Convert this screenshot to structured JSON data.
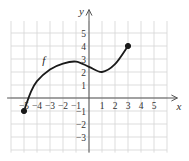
{
  "chart_data": {
    "type": "line",
    "title": "",
    "xlabel": "x",
    "ylabel": "y",
    "function_label": "f",
    "xlim": [
      -6,
      6
    ],
    "ylim": [
      -4,
      6
    ],
    "grid": true,
    "x_tick_labels": [
      "-5",
      "-4",
      "-3",
      "-2",
      "-1",
      "1",
      "2",
      "3",
      "4",
      "5"
    ],
    "y_tick_labels": [
      "5",
      "4",
      "3",
      "2",
      "1",
      "-1",
      "-2",
      "-3"
    ],
    "x_ticks": [
      -5,
      -4,
      -3,
      -2,
      -1,
      1,
      2,
      3,
      4,
      5
    ],
    "y_ticks": [
      5,
      4,
      3,
      2,
      1,
      -1,
      -2,
      -3
    ],
    "series": [
      {
        "name": "f",
        "x": [
          -5,
          -4.5,
          -4,
          -3,
          -2,
          -1,
          0,
          1,
          2,
          3
        ],
        "y": [
          -1,
          0.4,
          1.3,
          2.2,
          2.65,
          2.8,
          2.4,
          2.0,
          2.6,
          4.0
        ]
      }
    ],
    "endpoints": [
      {
        "x": -5,
        "y": -1,
        "filled": true
      },
      {
        "x": 3,
        "y": 4,
        "filled": true
      }
    ],
    "colors": {
      "grid": "#d4d4d4",
      "axis": "#555555",
      "curve": "#1a1a1a"
    }
  }
}
